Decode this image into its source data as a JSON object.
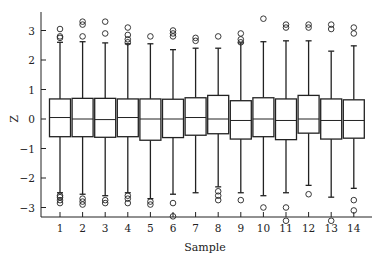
{
  "chart_data": {
    "type": "box",
    "title": "",
    "xlabel": "Sample",
    "ylabel": "Z",
    "ylim": [
      -3.6,
      3.6
    ],
    "yticks": [
      3,
      2,
      1,
      0,
      -1,
      -2,
      -3
    ],
    "ytick_labels": [
      "3",
      "2",
      "1",
      "0",
      "−1",
      "−2",
      "−3"
    ],
    "categories": [
      "1",
      "2",
      "3",
      "4",
      "5",
      "6",
      "7",
      "8",
      "9",
      "10",
      "11",
      "12",
      "13",
      "14"
    ],
    "grid": false,
    "boxes": [
      {
        "q1": -0.6,
        "median": 0.05,
        "q3": 0.68,
        "whisker_low": -2.5,
        "whisker_high": 2.6,
        "outliers_high": [
          2.75,
          2.8,
          3.05
        ],
        "outliers_low": [
          -2.6,
          -2.65,
          -2.75,
          -2.85
        ]
      },
      {
        "q1": -0.6,
        "median": 0.0,
        "q3": 0.7,
        "whisker_low": -2.55,
        "whisker_high": 2.62,
        "outliers_high": [
          2.8,
          3.2,
          3.3
        ],
        "outliers_low": [
          -2.7,
          -2.8,
          -2.9
        ]
      },
      {
        "q1": -0.62,
        "median": -0.02,
        "q3": 0.7,
        "whisker_low": -2.6,
        "whisker_high": 2.58,
        "outliers_high": [
          2.9,
          3.3
        ],
        "outliers_low": [
          -2.75,
          -2.85
        ]
      },
      {
        "q1": -0.6,
        "median": 0.05,
        "q3": 0.68,
        "whisker_low": -2.5,
        "whisker_high": 2.55,
        "outliers_high": [
          2.6,
          2.7,
          2.85,
          3.1
        ],
        "outliers_low": [
          -2.6,
          -2.7,
          -2.85
        ]
      },
      {
        "q1": -0.72,
        "median": 0.0,
        "q3": 0.68,
        "whisker_low": -2.7,
        "whisker_high": 2.55,
        "outliers_high": [
          2.8
        ],
        "outliers_low": [
          -2.8,
          -2.9
        ]
      },
      {
        "q1": -0.63,
        "median": 0.0,
        "q3": 0.67,
        "whisker_low": -2.55,
        "whisker_high": 2.35,
        "outliers_high": [
          2.8,
          2.9,
          3.0
        ],
        "outliers_low": [
          -2.85,
          -3.3
        ]
      },
      {
        "q1": -0.55,
        "median": 0.05,
        "q3": 0.72,
        "whisker_low": -2.5,
        "whisker_high": 2.4,
        "outliers_high": [
          2.65,
          2.75
        ],
        "outliers_low": []
      },
      {
        "q1": -0.5,
        "median": 0.0,
        "q3": 0.8,
        "whisker_low": -2.3,
        "whisker_high": 2.4,
        "outliers_high": [
          2.8
        ],
        "outliers_low": [
          -2.45,
          -2.6,
          -2.75
        ]
      },
      {
        "q1": -0.68,
        "median": -0.05,
        "q3": 0.62,
        "whisker_low": -2.5,
        "whisker_high": 2.58,
        "outliers_high": [
          2.6,
          2.7,
          2.9
        ],
        "outliers_low": [
          -2.75
        ]
      },
      {
        "q1": -0.6,
        "median": 0.0,
        "q3": 0.72,
        "whisker_low": -2.6,
        "whisker_high": 2.62,
        "outliers_high": [
          3.4
        ],
        "outliers_low": [
          -3.0
        ]
      },
      {
        "q1": -0.7,
        "median": -0.05,
        "q3": 0.68,
        "whisker_low": -2.5,
        "whisker_high": 2.65,
        "outliers_high": [
          3.1,
          3.2
        ],
        "outliers_low": [
          -3.0,
          -3.45
        ]
      },
      {
        "q1": -0.48,
        "median": 0.0,
        "q3": 0.8,
        "whisker_low": -2.25,
        "whisker_high": 2.65,
        "outliers_high": [
          3.1,
          3.2
        ],
        "outliers_low": [
          -2.55
        ]
      },
      {
        "q1": -0.68,
        "median": -0.05,
        "q3": 0.68,
        "whisker_low": -2.65,
        "whisker_high": 2.3,
        "outliers_high": [
          3.05,
          3.2
        ],
        "outliers_low": [
          -3.45
        ]
      },
      {
        "q1": -0.65,
        "median": -0.05,
        "q3": 0.65,
        "whisker_low": -2.35,
        "whisker_high": 2.48,
        "outliers_high": [
          2.9,
          3.1
        ],
        "outliers_low": [
          -2.75,
          -3.1
        ]
      }
    ]
  }
}
